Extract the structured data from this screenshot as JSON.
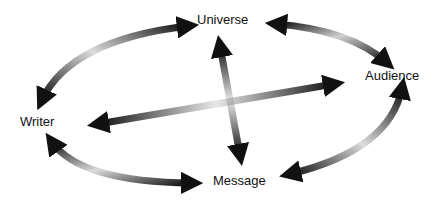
{
  "diagram": {
    "type": "communication-triangle-cycle",
    "nodes": [
      {
        "id": "universe",
        "label": "Universe"
      },
      {
        "id": "audience",
        "label": "Audience"
      },
      {
        "id": "writer",
        "label": "Writer"
      },
      {
        "id": "message",
        "label": "Message"
      }
    ],
    "edges": [
      {
        "from": "writer",
        "to": "universe",
        "style": "double-arrow-curved"
      },
      {
        "from": "universe",
        "to": "audience",
        "style": "double-arrow-curved"
      },
      {
        "from": "audience",
        "to": "message",
        "style": "double-arrow-curved"
      },
      {
        "from": "message",
        "to": "writer",
        "style": "double-arrow-curved"
      },
      {
        "from": "universe",
        "to": "message",
        "style": "double-arrow-straight"
      },
      {
        "from": "writer",
        "to": "audience",
        "style": "double-arrow-straight"
      }
    ],
    "colors": {
      "arrow": "#111111",
      "background": "#ffffff",
      "text": "#111111"
    }
  }
}
